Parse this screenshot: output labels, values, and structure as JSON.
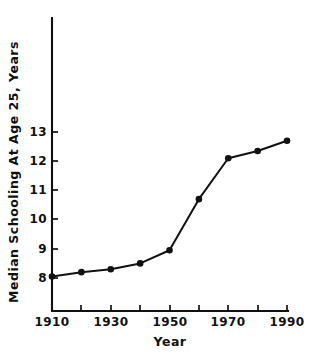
{
  "chart_data": {
    "type": "line",
    "title": "",
    "xlabel": "Year",
    "ylabel": "Median Schooling At Age 25, Years",
    "x": [
      1910,
      1920,
      1930,
      1940,
      1950,
      1960,
      1970,
      1980,
      1990
    ],
    "values": [
      8.05,
      8.2,
      8.3,
      8.5,
      8.95,
      10.7,
      12.1,
      12.35,
      12.7
    ],
    "series": [
      {
        "name": "Median Schooling At Age 25",
        "values": [
          8.05,
          8.2,
          8.3,
          8.5,
          8.95,
          10.7,
          12.1,
          12.35,
          12.7
        ]
      }
    ],
    "xlim": [
      1910,
      1990
    ],
    "ylim": [
      7.2,
      13.6
    ],
    "grid": false,
    "legend": "none",
    "marker": "filled-circle",
    "line_color": "#111111",
    "marker_color": "#111111",
    "background_color": "#ffffff",
    "x_ticks": [
      1910,
      1920,
      1930,
      1940,
      1950,
      1960,
      1970,
      1980,
      1990
    ],
    "x_tick_labels": [
      "1910",
      "",
      "1930",
      "",
      "1950",
      "",
      "1970",
      "",
      "1990"
    ],
    "x_major_labels": [
      "1910",
      "1930",
      "1950",
      "1970",
      "1990"
    ],
    "y_ticks": [
      8,
      9,
      10,
      11,
      12,
      13
    ],
    "y_tick_labels": [
      "8",
      "9",
      "10",
      "11",
      "12",
      "13"
    ]
  },
  "axes": {
    "x_title": "Year",
    "y_title": "Median Schooling At Age 25, Years"
  },
  "x_tick_labels_positioned": [
    {
      "label": "1910",
      "x": 52
    },
    {
      "label": "1930",
      "x": 111
    },
    {
      "label": "1950",
      "x": 170
    },
    {
      "label": "1970",
      "x": 228
    },
    {
      "label": "1990",
      "x": 287
    }
  ],
  "y_tick_labels_positioned": [
    {
      "label": "13",
      "y": 132
    },
    {
      "label": "12",
      "y": 161
    },
    {
      "label": "11",
      "y": 190
    },
    {
      "label": "10",
      "y": 219
    },
    {
      "label": "9",
      "y": 249
    },
    {
      "label": "8",
      "y": 278
    }
  ]
}
